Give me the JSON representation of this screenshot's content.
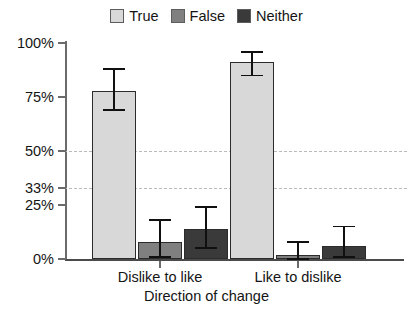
{
  "chart_data": {
    "type": "bar",
    "title": "",
    "xlabel": "Direction of change",
    "ylabel": "",
    "categories": [
      "Dislike to like",
      "Like to dislike"
    ],
    "ylim": [
      0,
      100
    ],
    "yticks": [
      "0%",
      "25%",
      "33%",
      "50%",
      "75%",
      "100%"
    ],
    "ytick_values": [
      0,
      25,
      33,
      50,
      75,
      100
    ],
    "gridlines": [
      33,
      50
    ],
    "grid": "dashed-horizontal-at-33-and-50",
    "legend_position": "top-center",
    "error_bars": "95% confidence intervals",
    "series": [
      {
        "name": "True",
        "color": "#d8d8d8",
        "values": [
          78,
          91
        ],
        "ci_low": [
          69,
          85
        ],
        "ci_high": [
          88,
          96
        ]
      },
      {
        "name": "False",
        "color": "#808080",
        "values": [
          8,
          2
        ],
        "ci_low": [
          1,
          0
        ],
        "ci_high": [
          18,
          8
        ]
      },
      {
        "name": "Neither",
        "color": "#3a3a3a",
        "values": [
          14,
          6
        ],
        "ci_low": [
          5,
          1
        ],
        "ci_high": [
          24,
          15
        ]
      }
    ]
  },
  "legend": {
    "items": [
      {
        "label": "True",
        "color": "#d8d8d8"
      },
      {
        "label": "False",
        "color": "#808080"
      },
      {
        "label": "Neither",
        "color": "#3a3a3a"
      }
    ]
  },
  "y_axis": {
    "ticks": [
      {
        "label": "100%",
        "value": 100
      },
      {
        "label": "75%",
        "value": 75
      },
      {
        "label": "50%",
        "value": 50
      },
      {
        "label": "33%",
        "value": 33
      },
      {
        "label": "25%",
        "value": 25
      },
      {
        "label": "0%",
        "value": 0
      }
    ]
  },
  "x_axis": {
    "title": "Direction of change",
    "categories": [
      "Dislike to like",
      "Like to dislike"
    ]
  },
  "colors": {
    "true_fill": "#d8d8d8",
    "false_fill": "#808080",
    "neither_fill": "#3a3a3a",
    "bar_edge": "#2b2b2b",
    "gridline": "#b9b9b9",
    "axis": "#6b6b6b",
    "text": "#141414",
    "background": "#ffffff"
  }
}
